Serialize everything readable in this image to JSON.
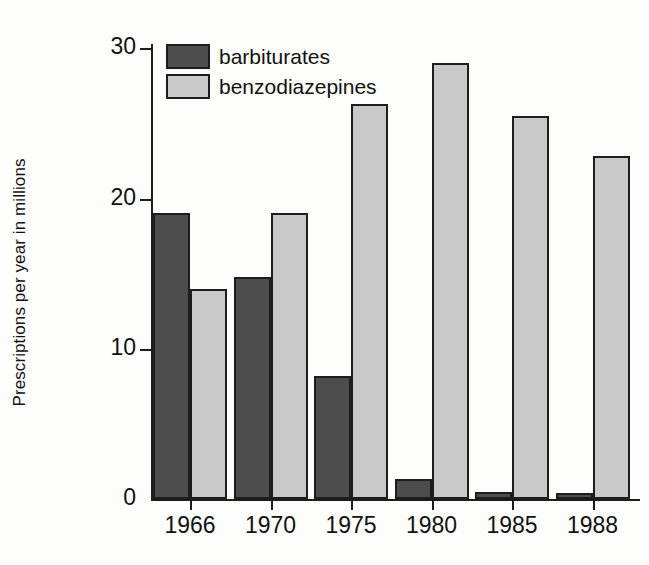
{
  "chart_data": {
    "type": "bar",
    "title": "",
    "xlabel": "",
    "ylabel": "Prescriptions per year in millions",
    "categories": [
      "1966",
      "1970",
      "1975",
      "1980",
      "1985",
      "1988"
    ],
    "series": [
      {
        "name": "barbiturates",
        "color": "#4d4d4d",
        "values": [
          19.0,
          14.8,
          8.2,
          1.3,
          0.45,
          0.4
        ]
      },
      {
        "name": "benzodiazepines",
        "color": "#c9c9c9",
        "values": [
          14.0,
          19.0,
          26.3,
          29.0,
          25.5,
          22.8
        ]
      }
    ],
    "ylim": [
      0,
      30
    ],
    "yticks": [
      0,
      10,
      20,
      30
    ],
    "ytick_labels": [
      "0",
      "10",
      "20",
      "30"
    ],
    "grid": false,
    "legend_position": "top-left",
    "axis_color": "#1d1d1d",
    "background": "#fdfdfb"
  }
}
